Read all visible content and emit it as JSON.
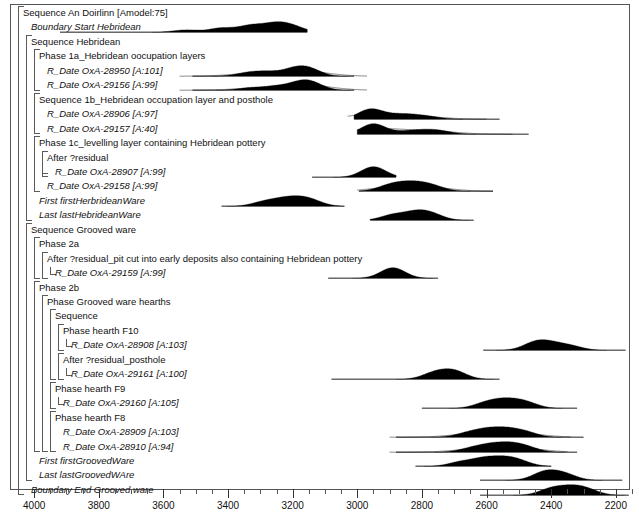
{
  "axis": {
    "label": "",
    "min": 2150,
    "max": 4050,
    "reversed": true,
    "major_ticks": [
      4000,
      3800,
      3600,
      3400,
      3200,
      3000,
      2800,
      2600,
      2400,
      2200
    ],
    "minor_tick_step": 50,
    "tick_labels": [
      "4000",
      "3800",
      "3600",
      "3400",
      "3200",
      "3000",
      "2800",
      "2600",
      "2400",
      "2200"
    ]
  },
  "rows": [
    {
      "label": "Sequence An Doirlinn [Amodel:75]",
      "indent": 0,
      "italic": false,
      "y": 12,
      "bracket": "open",
      "type": "sequence"
    },
    {
      "label": "Boundary Start Hebridean",
      "indent": 1,
      "italic": true,
      "y": 29,
      "type": "boundary"
    },
    {
      "label": "Sequence Hebridean",
      "indent": 1,
      "italic": false,
      "y": 45,
      "bracket": "open",
      "type": "sequence"
    },
    {
      "label": "Phase 1a_Hebridean oocupation layers",
      "indent": 2,
      "italic": false,
      "y": 61,
      "bracket": "open",
      "type": "phase"
    },
    {
      "label": "R_Date OxA-28950 [A:101]",
      "indent": 3,
      "italic": true,
      "y": 77,
      "type": "date"
    },
    {
      "label": "R_Date OxA-29156 [A:99]",
      "indent": 3,
      "italic": true,
      "y": 93,
      "type": "date"
    },
    {
      "label": "Sequence 1b_Hebridean occupation layer and posthole",
      "indent": 2,
      "italic": false,
      "y": 109,
      "bracket": "open",
      "type": "sequence"
    },
    {
      "label": "R_Date OxA-28906 [A:97]",
      "indent": 3,
      "italic": true,
      "y": 125,
      "type": "date"
    },
    {
      "label": "R_Date OxA-29157 [A:40]",
      "indent": 3,
      "italic": true,
      "y": 141,
      "type": "date"
    },
    {
      "label": "Phase 1c_levelling layer containing Hebridean pottery",
      "indent": 2,
      "italic": false,
      "y": 157,
      "bracket": "open",
      "type": "phase"
    },
    {
      "label": "After ?residual",
      "indent": 3,
      "italic": false,
      "y": 173,
      "bracket": "open",
      "type": "after"
    },
    {
      "label": "R_Date OxA-28907 [A:99]",
      "indent": 4,
      "italic": true,
      "y": 189,
      "type": "date"
    },
    {
      "label": "R_Date OxA-29158 [A:99]",
      "indent": 3,
      "italic": true,
      "y": 205,
      "type": "date"
    },
    {
      "label": "First firstHerbrideanWare",
      "indent": 2,
      "italic": true,
      "y": 221,
      "type": "first"
    },
    {
      "label": "Last lastHebrideanWare",
      "indent": 2,
      "italic": true,
      "y": 237,
      "type": "last"
    },
    {
      "label": "Sequence Grooved ware",
      "indent": 1,
      "italic": false,
      "y": 253,
      "bracket": "open",
      "type": "sequence"
    },
    {
      "label": "Phase 2a",
      "indent": 2,
      "italic": false,
      "y": 269,
      "bracket": "open",
      "type": "phase"
    },
    {
      "label": "After ?residual_pit cut into early deposits also containing Hebridean pottery",
      "indent": 3,
      "italic": false,
      "y": 285,
      "bracket": "open",
      "type": "after"
    },
    {
      "label": "R_Date OxA-29159 [A:99]",
      "indent": 4,
      "italic": true,
      "y": 301,
      "type": "date"
    },
    {
      "label": "Phase 2b",
      "indent": 2,
      "italic": false,
      "y": 317,
      "bracket": "open",
      "type": "phase"
    },
    {
      "label": "Phase Grooved ware hearths",
      "indent": 3,
      "italic": false,
      "y": 333,
      "bracket": "open",
      "type": "phase"
    },
    {
      "label": "Sequence",
      "indent": 4,
      "italic": false,
      "y": 349,
      "bracket": "open",
      "type": "sequence"
    },
    {
      "label": "Phase hearth F10",
      "indent": 5,
      "italic": false,
      "y": 365,
      "bracket": "open",
      "type": "phase"
    },
    {
      "label": "R_Date OxA-28908 [A:103]",
      "indent": 6,
      "italic": true,
      "y": 381,
      "type": "date"
    },
    {
      "label": "After ?residual_posthole",
      "indent": 5,
      "italic": false,
      "y": 397,
      "bracket": "open",
      "type": "after"
    },
    {
      "label": "R_Date OxA-29161 [A:100]",
      "indent": 6,
      "italic": true,
      "y": 413,
      "type": "date"
    },
    {
      "label": "Phase hearth F9",
      "indent": 4,
      "italic": false,
      "y": 429,
      "bracket": "open",
      "type": "phase"
    },
    {
      "label": "R_Date OxA-29160 [A:105]",
      "indent": 5,
      "italic": true,
      "y": 445,
      "type": "date"
    },
    {
      "label": "Phase hearth F8",
      "indent": 4,
      "italic": false,
      "y": 461,
      "bracket": "open",
      "type": "phase"
    },
    {
      "label": "R_Date OxA-28909 [A:103]",
      "indent": 5,
      "italic": true,
      "y": 477,
      "type": "date"
    },
    {
      "label": "R_Date OxA-28910 [A:94]",
      "indent": 5,
      "italic": true,
      "y": 493,
      "type": "date"
    },
    {
      "label": "First firstGroovedWare",
      "indent": 2,
      "italic": true,
      "y": 509,
      "type": "first"
    },
    {
      "label": "Last lastGroovedWAre",
      "indent": 2,
      "italic": true,
      "y": 525,
      "type": "last"
    },
    {
      "label": "Boundary End Grooved ware",
      "indent": 1,
      "italic": true,
      "y": 541,
      "type": "boundary"
    }
  ],
  "chart_data": {
    "type": "area",
    "xlabel": "Calibrated date (calBC)",
    "ylabel": "",
    "xlim": [
      4050,
      2150
    ],
    "grid": false,
    "legend": "none",
    "distributions": [
      {
        "name": "Boundary Start Hebridean",
        "row": 1,
        "filled_range": [
          3570,
          3160
        ],
        "outline_range": null,
        "span": [
          3920,
          3155
        ],
        "peaks_cal": [
          3530,
          3420,
          3330,
          3255,
          3200
        ],
        "peak_heights": [
          0.3,
          0.55,
          0.85,
          1.0,
          0.7
        ]
      },
      {
        "name": "R_Date OxA-28950",
        "row": 4,
        "filled_range": [
          3350,
          3090
        ],
        "outline_range": [
          3510,
          3010
        ],
        "span": [
          3510,
          3010
        ],
        "peaks_cal": [
          3340,
          3280,
          3200,
          3150
        ],
        "peak_heights": [
          0.45,
          0.55,
          0.85,
          1.0
        ]
      },
      {
        "name": "R_Date OxA-29156",
        "row": 5,
        "filled_range": [
          3350,
          3090
        ],
        "outline_range": [
          3510,
          3010
        ],
        "span": [
          3510,
          3010
        ],
        "peaks_cal": [
          3330,
          3250,
          3180,
          3140
        ],
        "peak_heights": [
          0.4,
          0.6,
          0.95,
          1.0
        ]
      },
      {
        "name": "R_Date OxA-28906",
        "row": 7,
        "filled_range": [
          3000,
          2930
        ],
        "outline_range": [
          2990,
          2640
        ],
        "span": [
          3010,
          2560
        ],
        "peaks_cal": [
          2960,
          2890,
          2840,
          2780
        ],
        "peak_heights": [
          1.0,
          0.3,
          0.35,
          0.25
        ]
      },
      {
        "name": "R_Date OxA-29157",
        "row": 8,
        "filled_range": [
          2985,
          2915
        ],
        "outline_range": [
          2960,
          2560
        ],
        "span": [
          3000,
          2470
        ],
        "peaks_cal": [
          2950,
          2850,
          2790,
          2740
        ],
        "peak_heights": [
          1.0,
          0.25,
          0.3,
          0.25
        ]
      },
      {
        "name": "R_Date OxA-28907",
        "row": 11,
        "filled_range": [
          2975,
          2915
        ],
        "outline_range": null,
        "span": [
          3140,
          2880
        ],
        "peaks_cal": [
          2950
        ],
        "peak_heights": [
          1.0
        ]
      },
      {
        "name": "R_Date OxA-29158",
        "row": 12,
        "filled_range": [
          2940,
          2700
        ],
        "outline_range": [
          2960,
          2620
        ],
        "span": [
          2995,
          2580
        ],
        "peaks_cal": [
          2905,
          2855,
          2805,
          2760
        ],
        "peak_heights": [
          0.8,
          1.0,
          0.95,
          0.6
        ]
      },
      {
        "name": "First firstHerbrideanWare",
        "row": 13,
        "filled_range": [
          3330,
          3080
        ],
        "outline_range": null,
        "span": [
          3420,
          3040
        ],
        "peaks_cal": [
          3290,
          3230,
          3180,
          3140
        ],
        "peak_heights": [
          0.7,
          1.0,
          0.95,
          0.75
        ]
      },
      {
        "name": "Last lastHebrideanWare",
        "row": 14,
        "filled_range": [
          2900,
          2720
        ],
        "outline_range": null,
        "span": [
          2960,
          2640
        ],
        "peaks_cal": [
          2890,
          2820,
          2770
        ],
        "peak_heights": [
          0.7,
          0.95,
          0.75
        ]
      },
      {
        "name": "R_Date OxA-29159",
        "row": 18,
        "filled_range": [
          2920,
          2860
        ],
        "outline_range": null,
        "span": [
          3090,
          2750
        ],
        "peaks_cal": [
          2890
        ],
        "peak_heights": [
          1.0
        ]
      },
      {
        "name": "R_Date OxA-28908",
        "row": 23,
        "filled_range": [
          2470,
          2380
        ],
        "outline_range": null,
        "span": [
          2610,
          2170
        ],
        "peaks_cal": [
          2450,
          2400,
          2340
        ],
        "peak_heights": [
          1.0,
          0.75,
          0.55
        ]
      },
      {
        "name": "R_Date OxA-29161",
        "row": 25,
        "filled_range": [
          2800,
          2660
        ],
        "outline_range": null,
        "span": [
          3080,
          2560
        ],
        "peaks_cal": [
          2760,
          2700
        ],
        "peak_heights": [
          0.8,
          1.0
        ]
      },
      {
        "name": "R_Date OxA-29160",
        "row": 27,
        "filled_range": [
          2620,
          2460
        ],
        "outline_range": null,
        "span": [
          2800,
          2320
        ],
        "peaks_cal": [
          2600,
          2540,
          2480
        ],
        "peak_heights": [
          0.75,
          1.0,
          0.8
        ]
      },
      {
        "name": "R_Date OxA-28909",
        "row": 29,
        "filled_range": [
          2640,
          2440
        ],
        "outline_range": [
          2860,
          2380
        ],
        "span": [
          2880,
          2300
        ],
        "peaks_cal": [
          2660,
          2600,
          2540,
          2480
        ],
        "peak_heights": [
          0.55,
          0.95,
          1.0,
          0.7
        ]
      },
      {
        "name": "R_Date OxA-28910",
        "row": 30,
        "filled_range": [
          2640,
          2450
        ],
        "outline_range": [
          2860,
          2390
        ],
        "span": [
          2880,
          2320
        ],
        "peaks_cal": [
          2650,
          2590,
          2530,
          2475
        ],
        "peak_heights": [
          0.5,
          0.9,
          1.0,
          0.65
        ]
      },
      {
        "name": "First firstGroovedWare",
        "row": 31,
        "filled_range": [
          2660,
          2470
        ],
        "outline_range": null,
        "span": [
          2820,
          2400
        ],
        "peaks_cal": [
          2680,
          2610,
          2550,
          2500
        ],
        "peak_heights": [
          0.6,
          1.0,
          0.95,
          0.7
        ]
      },
      {
        "name": "Last lastGroovedWAre",
        "row": 32,
        "filled_range": [
          2440,
          2330
        ],
        "outline_range": null,
        "span": [
          2620,
          2180
        ],
        "peaks_cal": [
          2420,
          2360
        ],
        "peak_heights": [
          1.0,
          0.75
        ]
      },
      {
        "name": "Boundary End Grooved ware",
        "row": 33,
        "filled_range": [
          2430,
          2270
        ],
        "outline_range": null,
        "span": [
          2620,
          2160
        ],
        "peaks_cal": [
          2400,
          2340,
          2290
        ],
        "peak_heights": [
          0.95,
          1.0,
          0.8
        ]
      }
    ]
  }
}
